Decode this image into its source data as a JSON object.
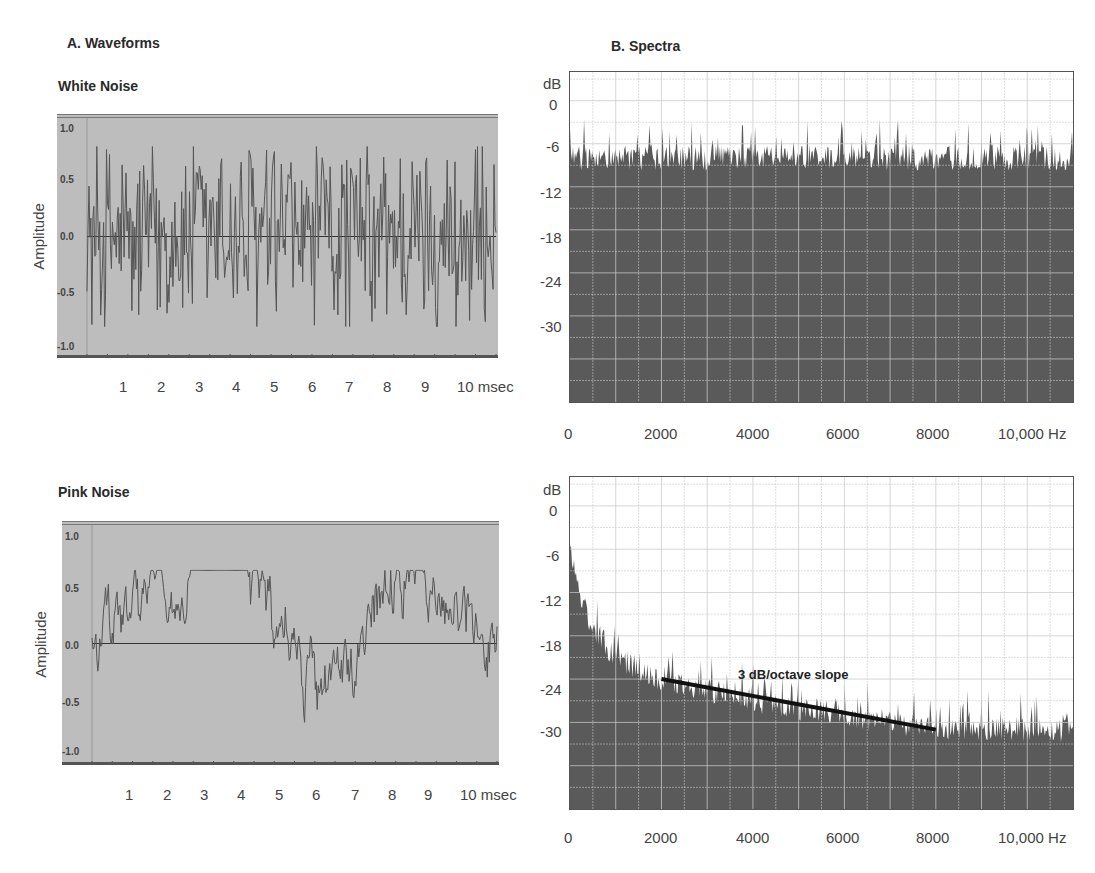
{
  "sections": {
    "waveforms_title": "A. Waveforms",
    "spectra_title": "B. Spectra"
  },
  "colors": {
    "waveform_bg": "#bdbdbd",
    "waveform_line": "#555555",
    "spectrum_fill": "#5a5a5a",
    "grid_line": "#9a9a9a",
    "annotation_line": "#111111"
  },
  "white_noise": {
    "title": "White Noise",
    "ylabel": "Amplitude",
    "yticks": [
      "1.0",
      "0.5",
      "0.0",
      "-0.5",
      "-1.0"
    ],
    "xticks": [
      "1",
      "2",
      "3",
      "4",
      "5",
      "6",
      "7",
      "8",
      "9",
      "10 msec"
    ]
  },
  "pink_noise": {
    "title": "Pink Noise",
    "ylabel": "Amplitude",
    "yticks": [
      "1.0",
      "0.5",
      "0.0",
      "-0.5",
      "-1.0"
    ],
    "xticks": [
      "1",
      "2",
      "3",
      "4",
      "5",
      "6",
      "7",
      "8",
      "9",
      "10 msec"
    ]
  },
  "white_spectrum": {
    "yunit": "dB",
    "yticks": [
      "0",
      "-6",
      "-12",
      "-18",
      "-24",
      "-30"
    ],
    "xticks": [
      "0",
      "2000",
      "4000",
      "6000",
      "8000",
      "10,000 Hz"
    ]
  },
  "pink_spectrum": {
    "yunit": "dB",
    "yticks": [
      "0",
      "-6",
      "-12",
      "-18",
      "-24",
      "-30"
    ],
    "xticks": [
      "0",
      "2000",
      "4000",
      "6000",
      "8000",
      "10,000 Hz"
    ],
    "annotation": "3 dB/octave slope"
  },
  "chart_data": [
    {
      "type": "line",
      "title": "White Noise",
      "xlabel": "msec",
      "ylabel": "Amplitude",
      "xlim": [
        0,
        10.5
      ],
      "ylim": [
        -1.0,
        1.0
      ],
      "x_ticks": [
        1,
        2,
        3,
        4,
        5,
        6,
        7,
        8,
        9,
        10
      ],
      "y_ticks": [
        1.0,
        0.5,
        0.0,
        -0.5,
        -1.0
      ],
      "description": "Random broadband waveform oscillating roughly between -0.8 and +0.8 amplitude",
      "amplitude_range": [
        -0.8,
        0.8
      ]
    },
    {
      "type": "area",
      "title": "White Noise Spectrum",
      "xlabel": "Hz",
      "ylabel": "dB",
      "xlim": [
        0,
        11000
      ],
      "ylim": [
        -42,
        4
      ],
      "x_ticks": [
        0,
        2000,
        4000,
        6000,
        8000,
        10000
      ],
      "y_ticks": [
        0,
        -6,
        -12,
        -18,
        -24,
        -30
      ],
      "grid": true,
      "description": "Flat spectrum with level around -8 dB across all frequencies, peaks reaching about -4 dB",
      "x": [
        0,
        2000,
        4000,
        6000,
        8000,
        10000,
        11000
      ],
      "values": [
        -8,
        -8,
        -8,
        -8,
        -8,
        -8,
        -8
      ]
    },
    {
      "type": "line",
      "title": "Pink Noise",
      "xlabel": "msec",
      "ylabel": "Amplitude",
      "xlim": [
        0,
        10.5
      ],
      "ylim": [
        -1.0,
        1.0
      ],
      "x_ticks": [
        1,
        2,
        3,
        4,
        5,
        6,
        7,
        8,
        9,
        10
      ],
      "y_ticks": [
        1.0,
        0.5,
        0.0,
        -0.5,
        -1.0
      ],
      "description": "Low-frequency-weighted waveform, amplitude roughly between -0.7 and +0.65",
      "amplitude_range": [
        -0.7,
        0.65
      ]
    },
    {
      "type": "area",
      "title": "Pink Noise Spectrum",
      "xlabel": "Hz",
      "ylabel": "dB",
      "xlim": [
        0,
        11000
      ],
      "ylim": [
        -42,
        4
      ],
      "x_ticks": [
        0,
        2000,
        4000,
        6000,
        8000,
        10000
      ],
      "y_ticks": [
        0,
        -6,
        -12,
        -18,
        -24,
        -30
      ],
      "grid": true,
      "description": "Spectrum falling from about -6 dB near 0 Hz to about -31 dB at high frequencies",
      "x": [
        0,
        250,
        500,
        1000,
        2000,
        4000,
        6000,
        8000,
        10000,
        11000
      ],
      "values": [
        -6,
        -13,
        -17,
        -21,
        -24,
        -27,
        -29,
        -31,
        -31,
        -31
      ],
      "annotations": [
        {
          "text": "3 dB/octave slope",
          "line_from": [
            2000,
            -24
          ],
          "line_to": [
            8000,
            -31
          ]
        }
      ]
    }
  ]
}
